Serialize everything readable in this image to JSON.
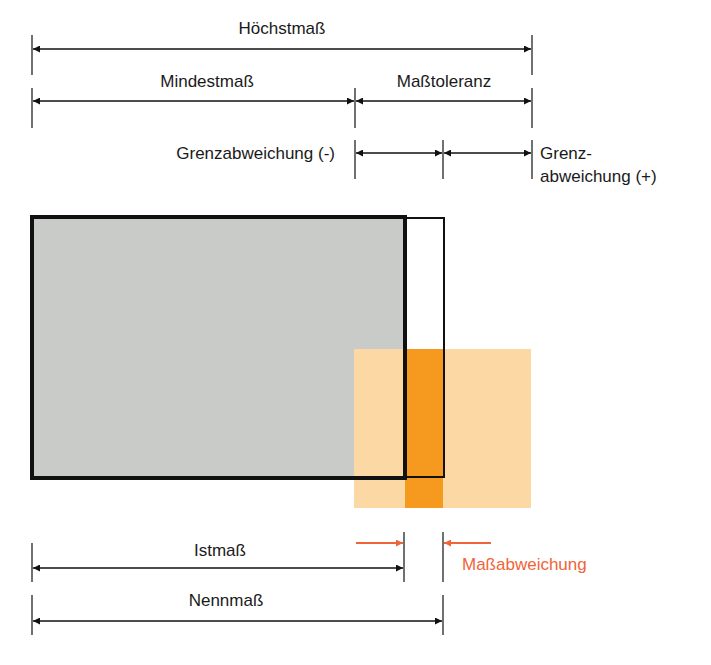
{
  "diagram": {
    "labels": {
      "hoechstmass": "Höchstmaß",
      "mindestmass": "Mindestmaß",
      "masstoleranz": "Maßtoleranz",
      "grenzabweichung_minus": "Grenzabweichung (-)",
      "grenzabweichung_plus_line1": "Grenz-",
      "grenzabweichung_plus_line2": "abweichung (+)",
      "istmass": "Istmaß",
      "nennmass": "Nennmaß",
      "massabweichung": "Maßabweichung"
    },
    "colors": {
      "line": "#111111",
      "part_fill": "#c9cbc8",
      "tolerance_zone_light": "#fcd9a4",
      "tolerance_zone_dark": "#f59a1e",
      "deviation_accent": "#f0643a"
    }
  }
}
